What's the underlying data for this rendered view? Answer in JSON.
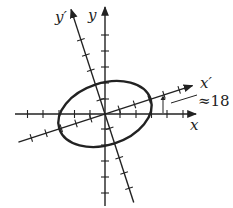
{
  "diagram": {
    "type": "rotated-axes-ellipse",
    "labels": {
      "x": "x",
      "y": "y",
      "x_prime": "x′",
      "y_prime": "y′",
      "angle": "≈18"
    },
    "rotation_degrees": 18,
    "colors": {
      "stroke": "#222222",
      "background": "#ffffff"
    }
  }
}
